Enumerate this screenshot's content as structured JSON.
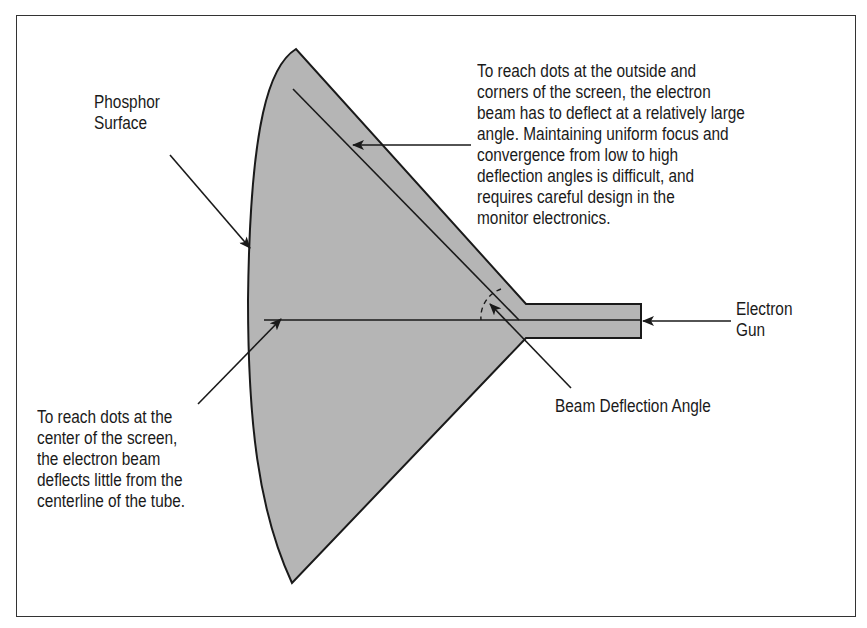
{
  "diagram": {
    "type": "CRT tube cross-section",
    "colors": {
      "tube_fill": "#b5b5b5",
      "stroke": "#1a1a1a",
      "frame": "#333333",
      "background": "#ffffff"
    },
    "labels": {
      "phosphor_surface": {
        "lines": [
          "Phosphor",
          "Surface"
        ]
      },
      "outer_note": {
        "lines": [
          "To reach dots at the outside and",
          "corners of the screen, the electron",
          "beam has to deflect at a relatively large",
          "angle.  Maintaining uniform focus and",
          "convergence from low to high",
          "deflection angles is difficult, and",
          "requires careful design in the",
          "monitor electronics."
        ]
      },
      "electron_gun": {
        "lines": [
          "Electron",
          "Gun"
        ]
      },
      "beam_deflection_angle": {
        "lines": [
          "Beam Deflection Angle"
        ]
      },
      "center_note": {
        "lines": [
          "To reach dots at the",
          "center of the screen,",
          "the electron beam",
          "deflects little from the",
          "centerline of the tube."
        ]
      }
    }
  }
}
